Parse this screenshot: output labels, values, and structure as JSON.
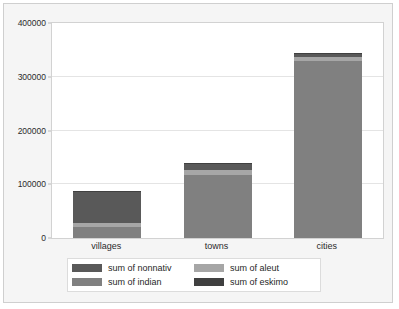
{
  "chart_data": {
    "type": "bar",
    "subtype": "stacked-bar",
    "title": "",
    "xlabel": "",
    "ylabel": "",
    "categories": [
      "villages",
      "towns",
      "cities"
    ],
    "ylim": [
      0,
      400000
    ],
    "yticks": [
      0,
      100000,
      200000,
      300000,
      400000
    ],
    "ytick_labels": [
      "0",
      "100000",
      "200000",
      "300000",
      "400000"
    ],
    "grid": true,
    "legend_position": "bottom",
    "stack_order_bottom_to_top": [
      "sum of indian",
      "sum of aleut",
      "sum of nonnativ",
      "sum of eskimo"
    ],
    "series": [
      {
        "name": "sum of indian",
        "color": "#808080",
        "values": [
          20000,
          118000,
          329000
        ]
      },
      {
        "name": "sum of aleut",
        "color": "#a6a6a6",
        "values": [
          8000,
          8000,
          7000
        ]
      },
      {
        "name": "sum of nonnativ",
        "color": "#595959",
        "values": [
          58000,
          12000,
          6000
        ]
      },
      {
        "name": "sum of eskimo",
        "color": "#404040",
        "values": [
          2000,
          2000,
          2000
        ]
      }
    ],
    "totals": [
      88000,
      140000,
      344000
    ]
  },
  "legend": {
    "items": [
      {
        "label": "sum of nonnativ",
        "color": "#595959"
      },
      {
        "label": "sum of aleut",
        "color": "#a6a6a6"
      },
      {
        "label": "sum of indian",
        "color": "#808080"
      },
      {
        "label": "sum of eskimo",
        "color": "#404040"
      }
    ]
  },
  "axis": {
    "y_ticks": [
      {
        "label": "400000",
        "value": 400000
      },
      {
        "label": "300000",
        "value": 300000
      },
      {
        "label": "200000",
        "value": 200000
      },
      {
        "label": "100000",
        "value": 100000
      },
      {
        "label": "0",
        "value": 0
      }
    ],
    "x_ticks": [
      {
        "label": "villages"
      },
      {
        "label": "towns"
      },
      {
        "label": "cities"
      }
    ]
  },
  "colors": {
    "panel_background": "#f5f5f5",
    "plot_background": "#ffffff",
    "gridline": "#e4e4e4",
    "border": "#cfcfcf",
    "text": "#2b2b2b"
  }
}
